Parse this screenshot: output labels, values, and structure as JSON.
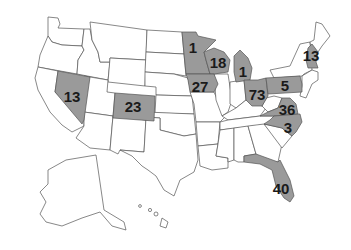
{
  "map": {
    "title": "United States",
    "highlight_color": "#9a9a9a",
    "base_color": "#ffffff",
    "border_color": "#555555",
    "highlighted_states": [
      {
        "state": "Nevada",
        "value": "13",
        "x": 72,
        "y": 96
      },
      {
        "state": "Colorado",
        "value": "23",
        "x": 133,
        "y": 106
      },
      {
        "state": "Minnesota",
        "value": "1",
        "x": 193,
        "y": 47
      },
      {
        "state": "Wisconsin",
        "value": "18",
        "x": 218,
        "y": 62
      },
      {
        "state": "Iowa",
        "value": "27",
        "x": 200,
        "y": 86
      },
      {
        "state": "Michigan",
        "value": "1",
        "x": 243,
        "y": 71
      },
      {
        "state": "Ohio",
        "value": "73",
        "x": 257,
        "y": 94
      },
      {
        "state": "Pennsylvania",
        "value": "5",
        "x": 285,
        "y": 85
      },
      {
        "state": "Virginia",
        "value": "36",
        "x": 287,
        "y": 109
      },
      {
        "state": "North Carolina",
        "value": "3",
        "x": 288,
        "y": 127
      },
      {
        "state": "New Hampshire/Massachusetts",
        "value": "13",
        "x": 311,
        "y": 55
      },
      {
        "state": "Florida",
        "value": "40",
        "x": 281,
        "y": 188
      }
    ]
  }
}
